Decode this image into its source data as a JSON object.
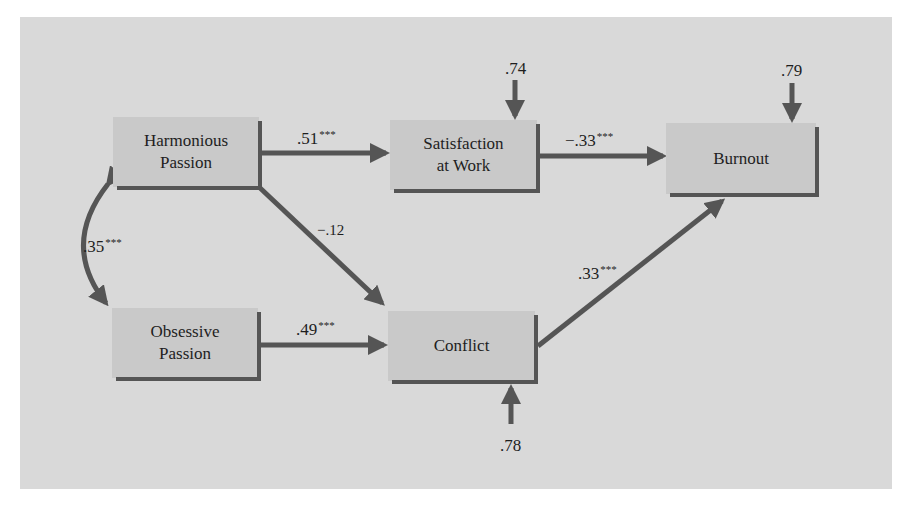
{
  "diagram": {
    "colors": {
      "panel": "#d9d9d9",
      "node_fill": "#c9c9c9",
      "arrow": "#555555",
      "text": "#1e1e1e"
    },
    "nodes": {
      "harmonious": {
        "line1": "Harmonious",
        "line2": "Passion"
      },
      "obsessive": {
        "line1": "Obsessive",
        "line2": "Passion"
      },
      "satisfaction": {
        "line1": "Satisfaction",
        "line2": "at Work"
      },
      "conflict": {
        "line1": "Conflict"
      },
      "burnout": {
        "line1": "Burnout"
      }
    },
    "paths": [
      {
        "from": "Harmonious Passion",
        "to": "Satisfaction at Work",
        "coef": ".51",
        "sig": "***"
      },
      {
        "from": "Harmonious Passion",
        "to": "Conflict",
        "coef": "−.12",
        "sig": ""
      },
      {
        "from": "Obsessive Passion",
        "to": "Conflict",
        "coef": ".49",
        "sig": "***"
      },
      {
        "from": "Satisfaction at Work",
        "to": "Burnout",
        "coef": "−.33",
        "sig": "***"
      },
      {
        "from": "Conflict",
        "to": "Burnout",
        "coef": ".33",
        "sig": "***"
      },
      {
        "from": "Harmonious Passion",
        "to": "Obsessive Passion",
        "coef": ".35",
        "sig": "***",
        "type": "correlation"
      }
    ],
    "residuals": {
      "satisfaction": ".74",
      "burnout": ".79",
      "conflict": ".78"
    }
  }
}
